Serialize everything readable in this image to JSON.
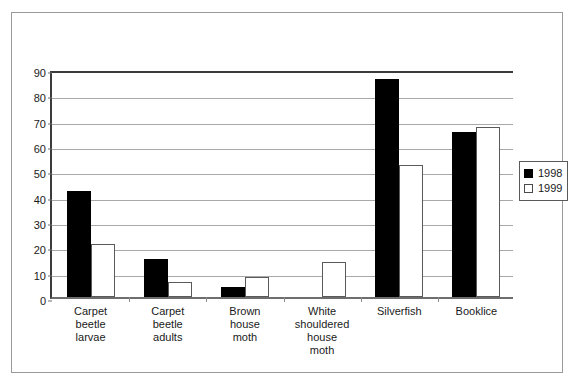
{
  "chart_data": {
    "type": "bar",
    "title": "",
    "xlabel": "",
    "ylabel": "",
    "ylim": [
      0,
      90
    ],
    "ytick_step": 10,
    "yticks": [
      0,
      10,
      20,
      30,
      40,
      50,
      60,
      70,
      80,
      90
    ],
    "ytick_labels": [
      "0",
      "10",
      "20",
      "30",
      "40",
      "50",
      "60",
      "70",
      "80",
      "90"
    ],
    "grid": true,
    "legend_position": "right",
    "categories": [
      "Carpet beetle larvae",
      "Carpet beetle adults",
      "Brown house moth",
      "White shouldered house moth",
      "Silverfish",
      "Booklice"
    ],
    "category_label_lines": [
      [
        "Carpet",
        "beetle",
        "larvae"
      ],
      [
        "Carpet",
        "beetle",
        "adults"
      ],
      [
        "Brown",
        "house",
        "moth"
      ],
      [
        "White",
        "shouldered",
        "house",
        "moth"
      ],
      [
        "Silverfish"
      ],
      [
        "Booklice"
      ]
    ],
    "series": [
      {
        "name": "1998",
        "color": "#000000",
        "values": [
          42,
          15,
          4,
          0,
          86,
          65
        ]
      },
      {
        "name": "1999",
        "color": "#ffffff",
        "edge_color": "#5a5a5a",
        "values": [
          21,
          6,
          8,
          14,
          52,
          67
        ]
      }
    ]
  },
  "legend": {
    "entries": [
      {
        "label": "1998",
        "swatch": "filled-black-square"
      },
      {
        "label": "1999",
        "swatch": "open-white-square"
      }
    ]
  },
  "colors": {
    "series_1998": "#000000",
    "series_1999": "#ffffff",
    "gridline": "#a9a9a9",
    "axis": "#3b3b3b",
    "frame_border": "#9a9a9a",
    "text": "#1a1a1a"
  }
}
